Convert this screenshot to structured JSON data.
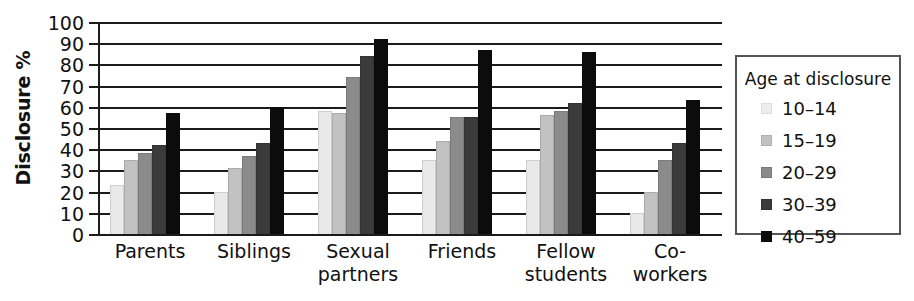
{
  "chart_data": {
    "type": "bar",
    "title": "",
    "xlabel": "",
    "ylabel": "Disclosure %",
    "ylim": [
      0,
      100
    ],
    "ytick_step": 10,
    "yticks": [
      0,
      10,
      20,
      30,
      40,
      50,
      60,
      70,
      80,
      90,
      100
    ],
    "grid": true,
    "legend_position": "right",
    "legend_title": "Age at disclosure",
    "categories": [
      "Parents",
      "Siblings",
      "Sexual partners",
      "Friends",
      "Fellow students",
      "Co-workers"
    ],
    "category_lines": [
      [
        "Parents"
      ],
      [
        "Siblings"
      ],
      [
        "Sexual",
        "partners"
      ],
      [
        "Friends"
      ],
      [
        "Fellow",
        "students"
      ],
      [
        "Co-workers"
      ]
    ],
    "series": [
      {
        "name": "10–14",
        "color": "#e9e9e9",
        "values": [
          23,
          20,
          58,
          35,
          35,
          10
        ]
      },
      {
        "name": "15–19",
        "color": "#c2c2c2",
        "values": [
          35,
          31,
          57,
          44,
          56,
          20
        ]
      },
      {
        "name": "20–29",
        "color": "#8b8b8b",
        "values": [
          38,
          37,
          74,
          55,
          58,
          35
        ]
      },
      {
        "name": "30–39",
        "color": "#3b3b3b",
        "values": [
          42,
          43,
          84,
          55,
          62,
          43
        ]
      },
      {
        "name": "40–59",
        "color": "#0c0c0c",
        "values": [
          57,
          60,
          92,
          87,
          86,
          63
        ]
      }
    ]
  },
  "legend": {
    "title": "Age at disclosure",
    "entries": [
      {
        "label": "10–14"
      },
      {
        "label": "15–19"
      },
      {
        "label": "20–29"
      },
      {
        "label": "30–39"
      },
      {
        "label": "40–59"
      }
    ]
  },
  "axis": {
    "y_title": "Disclosure %",
    "y_ticks": [
      "100",
      "90",
      "80",
      "70",
      "60",
      "50",
      "40",
      "30",
      "20",
      "10",
      "0"
    ]
  }
}
